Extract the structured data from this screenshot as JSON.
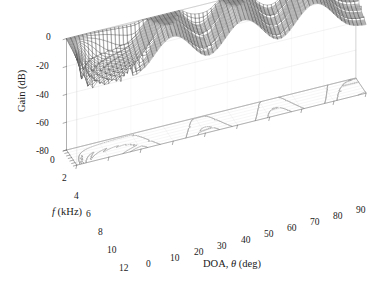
{
  "figure": {
    "kind": "3d-mesh-surface",
    "background": "#ffffff",
    "line_color": "#4a4a4a",
    "axis_color": "#555555",
    "text_color": "#1a1a1a"
  },
  "chart_data": {
    "type": "line",
    "render": "3d-mesh-surface-with-base-contours",
    "title": "",
    "subtitle": "",
    "xlabel": "DOA, θ (deg)",
    "ylabel": "f (kHz)",
    "zlabel": "Gain (dB)",
    "xlabel_parts": {
      "prefix": "DOA, ",
      "symbol": "θ",
      "suffix": " (deg)"
    },
    "ylabel_parts": {
      "symbol": "f",
      "suffix": " (kHz)"
    },
    "grid": true,
    "legend": null,
    "legend_position": "none",
    "xlim": [
      0,
      90
    ],
    "ylim": [
      0,
      12
    ],
    "zlim": [
      -80,
      0
    ],
    "xticks": [
      0,
      10,
      20,
      30,
      40,
      50,
      60,
      70,
      80,
      90
    ],
    "yticks": [
      0,
      2,
      4,
      6,
      8,
      10,
      12
    ],
    "zticks": [
      0,
      -20,
      -40,
      -60,
      -80
    ],
    "xtick_labels": [
      "0",
      "10",
      "20",
      "30",
      "40",
      "50",
      "60",
      "70",
      "80",
      "90"
    ],
    "ytick_labels": [
      "0",
      "2",
      "4",
      "6",
      "8",
      "10",
      "12"
    ],
    "ztick_labels": [
      "0",
      "-20",
      "-40",
      "-60",
      "-80"
    ],
    "x_units": "deg",
    "y_units": "kHz",
    "z_units": "dB",
    "view": {
      "azimuth_deg": -37.5,
      "elevation_deg": 30
    },
    "features": {
      "main_lobe_doa_deg": 0,
      "grating_lobe_doa_deg": [
        30,
        52,
        74
      ],
      "null_doa_deg": [
        22,
        42,
        63,
        85
      ],
      "peak_gain_db": 0,
      "floor_gain_db": -80
    },
    "mesh": {
      "x_samples": 73,
      "y_samples": 33,
      "shading": "wireframe",
      "hidden_line_removal": true
    },
    "base_contours": {
      "enabled": true,
      "levels_db": [
        -70,
        -60,
        -50,
        -40,
        -30,
        -20,
        -10
      ]
    },
    "series": [
      {
        "name": "Gain surface",
        "f_khz": [
          0,
          2,
          4,
          6,
          8,
          10,
          12
        ],
        "ridges_doa_deg": [
          0,
          30,
          52,
          74
        ],
        "values_db_at_ridges": [
          [
            -18,
            -20,
            -22,
            -25,
            -28,
            -31,
            -34
          ],
          [
            -36,
            -34,
            -33,
            -32,
            -31,
            -30,
            -30
          ],
          [
            -36,
            -35,
            -34,
            -33,
            -32,
            -31,
            -31
          ],
          [
            -35,
            -34,
            -33,
            -32,
            -32,
            -31,
            -31
          ]
        ]
      }
    ]
  },
  "axes": {
    "z": {
      "name": "Gain (dB)",
      "ticks": [
        {
          "label": "0",
          "x": 46,
          "y": 32
        },
        {
          "label": "-20",
          "x": 36,
          "y": 61
        },
        {
          "label": "-40",
          "x": 36,
          "y": 90
        },
        {
          "label": "-60",
          "x": 36,
          "y": 118
        },
        {
          "label": "-80",
          "x": 36,
          "y": 146
        }
      ]
    },
    "y": {
      "name": "f (kHz)",
      "ticks": [
        {
          "label": "0",
          "x": 50,
          "y": 155
        },
        {
          "label": "2",
          "x": 62,
          "y": 173
        },
        {
          "label": "4",
          "x": 74,
          "y": 191
        },
        {
          "label": "6",
          "x": 86,
          "y": 209
        },
        {
          "label": "8",
          "x": 98,
          "y": 227
        },
        {
          "label": "10",
          "x": 107,
          "y": 245
        },
        {
          "label": "12",
          "x": 119,
          "y": 263
        }
      ]
    },
    "x": {
      "name": "DOA, θ (deg)",
      "ticks": [
        {
          "label": "0",
          "x": 146,
          "y": 259
        },
        {
          "label": "10",
          "x": 170,
          "y": 253
        },
        {
          "label": "20",
          "x": 194,
          "y": 247
        },
        {
          "label": "30",
          "x": 217,
          "y": 241
        },
        {
          "label": "40",
          "x": 241,
          "y": 235
        },
        {
          "label": "50",
          "x": 264,
          "y": 229
        },
        {
          "label": "60",
          "x": 287,
          "y": 223
        },
        {
          "label": "70",
          "x": 310,
          "y": 217
        },
        {
          "label": "80",
          "x": 333,
          "y": 211
        },
        {
          "label": "90",
          "x": 356,
          "y": 205
        }
      ]
    }
  }
}
